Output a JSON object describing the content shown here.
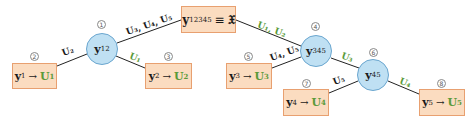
{
  "diagram": {
    "colors": {
      "leaf_fill": "#fbdcc0",
      "leaf_border": "#e8a070",
      "node_fill": "#bfe0f3",
      "node_border": "#6aa6cf",
      "green_label": "#5a9a3a",
      "edge": "#222222"
    },
    "root": {
      "symbol": "y",
      "subscript": "12345",
      "equals": "≡",
      "rhs": "𝔛"
    },
    "inner_nodes": [
      {
        "index": "1",
        "symbol": "y",
        "subscript": "12"
      },
      {
        "index": "4",
        "symbol": "y",
        "subscript": "345"
      },
      {
        "index": "6",
        "symbol": "y",
        "subscript": "45"
      }
    ],
    "leaves": [
      {
        "index": "2",
        "symbol": "y",
        "subscript": "1",
        "arrow": "→",
        "target": "U",
        "target_sub": "1"
      },
      {
        "index": "3",
        "symbol": "y",
        "subscript": "2",
        "arrow": "→",
        "target": "U",
        "target_sub": "2"
      },
      {
        "index": "5",
        "symbol": "y",
        "subscript": "3",
        "arrow": "→",
        "target": "U",
        "target_sub": "3"
      },
      {
        "index": "7",
        "symbol": "y",
        "subscript": "4",
        "arrow": "→",
        "target": "U",
        "target_sub": "4"
      },
      {
        "index": "8",
        "symbol": "y",
        "subscript": "5",
        "arrow": "→",
        "target": "U",
        "target_sub": "5"
      }
    ],
    "edge_labels": {
      "root_to_y12": "U₃, U₄, U₅",
      "root_to_y345": "U₁, U₂",
      "y12_to_leaf1": "U₂",
      "y12_to_leaf2": "U₁",
      "y345_to_leaf3": "U₄, U₅",
      "y345_to_y45": "U₃",
      "y45_to_leaf4": "U₅",
      "y45_to_leaf5": "U₄"
    }
  }
}
